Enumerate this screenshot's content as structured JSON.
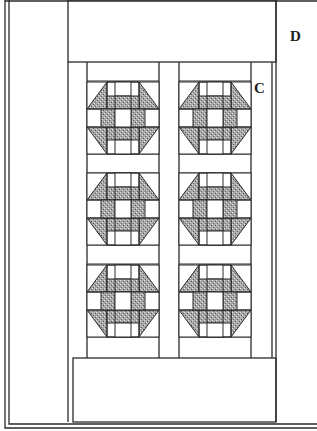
{
  "diagram": {
    "labels": {
      "d": "D",
      "c": "C"
    },
    "colors": {
      "line": "#2a2a2a",
      "shade": "#9a9a9a",
      "background": "#ffffff"
    },
    "blocks": {
      "columns": 2,
      "rows": 3,
      "pattern": "churn-dash"
    }
  }
}
